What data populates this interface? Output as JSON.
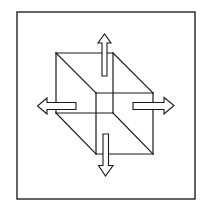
{
  "diagram": {
    "title": "Wireframe cube with four outward arrows",
    "colors": {
      "background": "#ffffff",
      "stroke": "#1a1a1a",
      "arrow_fill": "#ffffff"
    },
    "frame": {
      "x": 17,
      "y": 12,
      "width": 178,
      "height": 187
    },
    "cube": {
      "back_face": {
        "tl": [
          56,
          53
        ],
        "tr": [
          113,
          53
        ],
        "br": [
          113,
          113
        ],
        "bl": [
          56,
          113
        ]
      },
      "front_face": {
        "tl": [
          96,
          93
        ],
        "tr": [
          153,
          93
        ],
        "br": [
          153,
          154
        ],
        "bl": [
          96,
          154
        ]
      }
    },
    "arrows": [
      {
        "name": "up",
        "direction": "up"
      },
      {
        "name": "left",
        "direction": "left"
      },
      {
        "name": "right",
        "direction": "right"
      },
      {
        "name": "down",
        "direction": "down"
      }
    ]
  }
}
